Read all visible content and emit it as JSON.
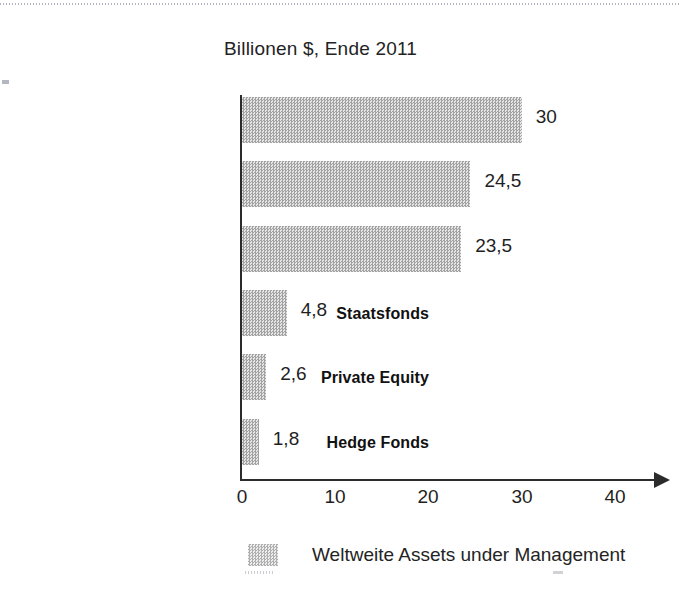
{
  "chart_data": {
    "type": "bar",
    "orientation": "horizontal",
    "title": "Billionen $, Ende 2011",
    "xlabel": "",
    "ylabel": "",
    "xlim": [
      0,
      40
    ],
    "grid": false,
    "legend_position": "bottom",
    "categories": [
      "Pensionsfonds",
      "Versicherungsfonds",
      "Publikumsfonds",
      "Staatsfonds",
      "Private Equity",
      "Hedge Fonds"
    ],
    "values": [
      30,
      24.5,
      23.5,
      4.8,
      2.6,
      1.8
    ],
    "value_labels": [
      "30",
      "24,5",
      "23,5",
      "4,8",
      "2,6",
      "1,8"
    ],
    "xticks": [
      0,
      10,
      20,
      30,
      40
    ],
    "xtick_labels": [
      "0",
      "10",
      "20",
      "30",
      "40"
    ],
    "series": [
      {
        "name": "Weltweite Assets under Management",
        "values": [
          30,
          24.5,
          23.5,
          4.8,
          2.6,
          1.8
        ]
      }
    ],
    "legend": [
      "Weltweite Assets under Management"
    ],
    "colors": {
      "bar_fill": "#c4c4c4",
      "axis": "#2b2b2b",
      "text": "#1f1f1f",
      "background": "#ffffff"
    }
  },
  "legend": {
    "swatch_name": "series-color-swatch",
    "label": "Weltweite Assets under Management"
  }
}
